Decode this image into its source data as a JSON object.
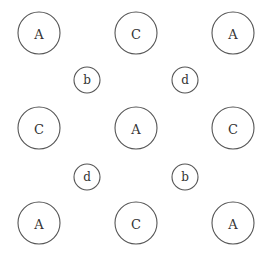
{
  "diagram": {
    "large_nodes": [
      {
        "label": "A",
        "row": 0,
        "col": 0
      },
      {
        "label": "C",
        "row": 0,
        "col": 1
      },
      {
        "label": "A",
        "row": 0,
        "col": 2
      },
      {
        "label": "C",
        "row": 1,
        "col": 0
      },
      {
        "label": "A",
        "row": 1,
        "col": 1
      },
      {
        "label": "C",
        "row": 1,
        "col": 2
      },
      {
        "label": "A",
        "row": 2,
        "col": 0
      },
      {
        "label": "C",
        "row": 2,
        "col": 1
      },
      {
        "label": "A",
        "row": 2,
        "col": 2
      }
    ],
    "small_nodes": [
      {
        "label": "b",
        "row": 0,
        "col": 0
      },
      {
        "label": "d",
        "row": 0,
        "col": 1
      },
      {
        "label": "d",
        "row": 1,
        "col": 0
      },
      {
        "label": "b",
        "row": 1,
        "col": 1
      }
    ]
  }
}
